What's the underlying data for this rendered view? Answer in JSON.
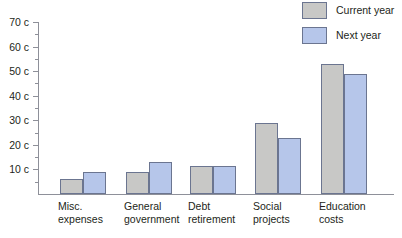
{
  "chart_data": {
    "type": "bar",
    "title": "",
    "xlabel": "",
    "ylabel": "",
    "ylim": [
      0,
      70
    ],
    "y_tick_step": 10,
    "y_minor_step": 5,
    "grid": false,
    "legend_position": "top-right",
    "y_tick_labels": [
      "70 c",
      "60 c",
      "50 c",
      "40 c",
      "30 c",
      "20 c",
      "10 c"
    ],
    "y_tick_values": [
      70,
      60,
      50,
      40,
      30,
      20,
      10
    ],
    "categories": [
      {
        "line1": "Misc.",
        "line2": "expenses"
      },
      {
        "line1": "General",
        "line2": "government"
      },
      {
        "line1": "Debt",
        "line2": "retirement"
      },
      {
        "line1": "Social",
        "line2": "projects"
      },
      {
        "line1": "Education",
        "line2": "costs"
      }
    ],
    "series": [
      {
        "name": "Current year",
        "color": "#c8c8c6",
        "values": [
          6,
          9,
          11.5,
          29,
          53
        ]
      },
      {
        "name": "Next year",
        "color": "#b6c6ea",
        "values": [
          9,
          13,
          11.5,
          23,
          49
        ]
      }
    ]
  },
  "legend": {
    "items": [
      {
        "label": "Current year",
        "swatch": "current"
      },
      {
        "label": "Next year",
        "swatch": "next"
      }
    ]
  },
  "colors": {
    "bar_current": "#c8c8c6",
    "bar_next": "#b6c6ea",
    "bar_border": "#6b7590",
    "axis": "#8e9099",
    "text": "#231f20",
    "background": "#ffffff"
  }
}
